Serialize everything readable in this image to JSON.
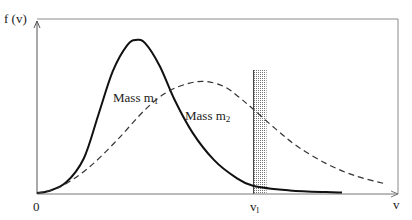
{
  "chart_data": {
    "type": "line",
    "title": "",
    "xlabel": "v",
    "ylabel": "f (v)",
    "x_tick_labels": [
      "0",
      "v_l"
    ],
    "x_origin_label": "0",
    "threshold": {
      "label": "v",
      "subscript": "l",
      "x": 0.6,
      "band_width": 0.036
    },
    "grid": false,
    "legend": "inline labels",
    "series": [
      {
        "name": "Mass m1",
        "label_text": "Mass m",
        "label_sub": "1",
        "style": "solid",
        "color": "#111111",
        "points": [
          [
            0.0,
            0.0
          ],
          [
            0.03,
            0.01
          ],
          [
            0.08,
            0.06
          ],
          [
            0.13,
            0.2
          ],
          [
            0.17,
            0.45
          ],
          [
            0.21,
            0.7
          ],
          [
            0.25,
            0.85
          ],
          [
            0.275,
            0.88
          ],
          [
            0.3,
            0.86
          ],
          [
            0.34,
            0.73
          ],
          [
            0.38,
            0.54
          ],
          [
            0.43,
            0.35
          ],
          [
            0.49,
            0.19
          ],
          [
            0.55,
            0.09
          ],
          [
            0.6,
            0.04
          ],
          [
            0.7,
            0.015
          ],
          [
            0.8,
            0.005
          ],
          [
            0.845,
            0.003
          ]
        ]
      },
      {
        "name": "Mass m2",
        "label_text": "Mass m",
        "label_sub": "2",
        "style": "dashed",
        "color": "#222222",
        "points": [
          [
            0.0,
            0.0
          ],
          [
            0.06,
            0.03
          ],
          [
            0.14,
            0.14
          ],
          [
            0.22,
            0.3
          ],
          [
            0.3,
            0.48
          ],
          [
            0.36,
            0.58
          ],
          [
            0.42,
            0.63
          ],
          [
            0.47,
            0.64
          ],
          [
            0.52,
            0.61
          ],
          [
            0.56,
            0.55
          ],
          [
            0.6,
            0.48
          ],
          [
            0.66,
            0.37
          ],
          [
            0.72,
            0.27
          ],
          [
            0.8,
            0.17
          ],
          [
            0.88,
            0.1
          ],
          [
            0.96,
            0.055
          ]
        ]
      }
    ],
    "xlim": [
      0,
      1
    ],
    "ylim": [
      0,
      1
    ]
  },
  "labels": {
    "y_axis": "f (v)",
    "x_axis": "v",
    "origin": "0",
    "threshold_main": "v",
    "threshold_sub": "l",
    "m1_main": "Mass m",
    "m1_sub": "1",
    "m2_main": "Mass m",
    "m2_sub": "2"
  }
}
